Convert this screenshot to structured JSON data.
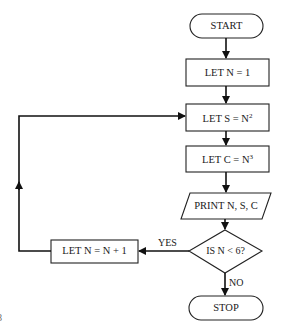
{
  "flowchart": {
    "nodes": [
      {
        "id": "start",
        "type": "terminator",
        "label": "START"
      },
      {
        "id": "init",
        "type": "process",
        "label": "LET N = 1"
      },
      {
        "id": "square",
        "type": "process",
        "label_base": "LET S = N",
        "label_sup": "2"
      },
      {
        "id": "cube",
        "type": "process",
        "label_base": "LET C = N",
        "label_sup": "3"
      },
      {
        "id": "print",
        "type": "io",
        "label": "PRINT N, S, C"
      },
      {
        "id": "decision",
        "type": "decision",
        "label": "IS N < 6?"
      },
      {
        "id": "increment",
        "type": "process",
        "label": "LET N = N + 1"
      },
      {
        "id": "stop",
        "type": "terminator",
        "label": "STOP"
      }
    ],
    "edges": [
      {
        "from": "start",
        "to": "init",
        "label": ""
      },
      {
        "from": "init",
        "to": "square",
        "label": ""
      },
      {
        "from": "square",
        "to": "cube",
        "label": ""
      },
      {
        "from": "cube",
        "to": "print",
        "label": ""
      },
      {
        "from": "print",
        "to": "decision",
        "label": ""
      },
      {
        "from": "decision",
        "to": "increment",
        "label": "YES"
      },
      {
        "from": "increment",
        "to": "square",
        "label": ""
      },
      {
        "from": "decision",
        "to": "stop",
        "label": "NO"
      }
    ],
    "edge_labels": {
      "yes": "YES",
      "no": "NO"
    },
    "margin_fragment": "8"
  }
}
